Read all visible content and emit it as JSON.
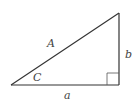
{
  "diagram": {
    "labels": {
      "hypotenuse": "A",
      "vertical_side": "b",
      "angle": "C",
      "horizontal_side": "a"
    },
    "colors": {
      "stroke": "#333333",
      "right_angle_marker": "#555555",
      "label": "#444444",
      "background": "#ffffff"
    }
  }
}
